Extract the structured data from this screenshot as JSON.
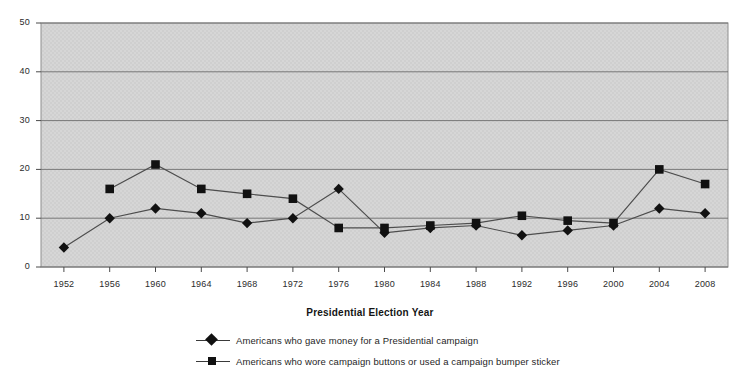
{
  "chart_data": {
    "type": "line",
    "title": "",
    "xlabel": "Presidential Election Year",
    "ylabel": "",
    "categories": [
      "1952",
      "1956",
      "1960",
      "1964",
      "1968",
      "1972",
      "1976",
      "1980",
      "1984",
      "1988",
      "1992",
      "1996",
      "2000",
      "2004",
      "2008"
    ],
    "yticks": [
      0,
      10,
      20,
      30,
      40,
      50
    ],
    "ylim": [
      0,
      50
    ],
    "grid": "horizontal",
    "legend_position": "bottom",
    "plot_background": "#d4d4d4",
    "series": [
      {
        "name": "Americans who gave money for a Presidential campaign",
        "marker": "diamond",
        "color": "#111111",
        "values": [
          4,
          10,
          12,
          11,
          9,
          10,
          16,
          7,
          8,
          8.5,
          6.5,
          7.5,
          8.5,
          12,
          11
        ]
      },
      {
        "name": "Americans who wore campaign buttons or used a campaign bumper sticker",
        "marker": "square",
        "color": "#111111",
        "values": [
          null,
          16,
          21,
          16,
          15,
          14,
          8,
          8,
          8.5,
          9,
          10.5,
          9.5,
          9,
          20,
          17
        ]
      }
    ]
  },
  "axis": {
    "y_tick_labels": [
      "0",
      "10",
      "20",
      "30",
      "40",
      "50"
    ],
    "x_tick_labels": [
      "1952",
      "1956",
      "1960",
      "1964",
      "1968",
      "1972",
      "1976",
      "1980",
      "1984",
      "1988",
      "1992",
      "1996",
      "2000",
      "2004",
      "2008"
    ],
    "x_title": "Presidential Election Year"
  },
  "legend": {
    "items": [
      {
        "label": "Americans who gave money for a Presidential campaign",
        "marker": "diamond"
      },
      {
        "label": "Americans who wore campaign buttons or used a campaign bumper sticker",
        "marker": "square"
      }
    ]
  }
}
